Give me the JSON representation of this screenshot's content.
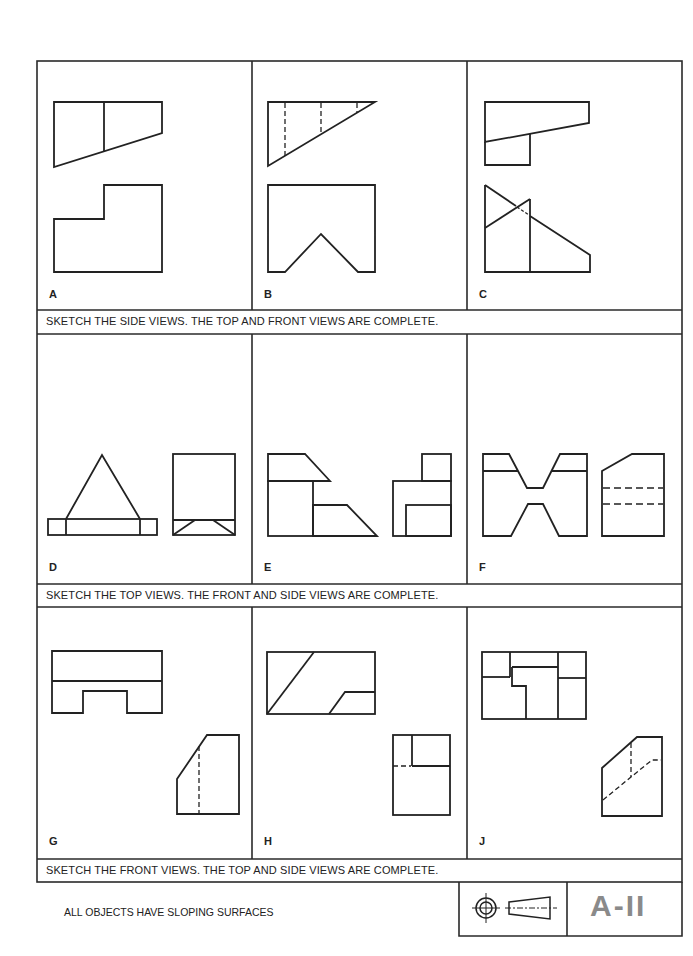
{
  "worksheet": {
    "sheet_number": "A-II",
    "footnote": "ALL OBJECTS HAVE SLOPING SURFACES",
    "title_block_icon": "third-angle-projection-symbol",
    "rows": [
      {
        "instruction": "SKETCH THE SIDE VIEWS.  THE TOP AND FRONT VIEWS ARE COMPLETE.",
        "panels": [
          {
            "label": "A",
            "given_views": [
              "top",
              "front"
            ]
          },
          {
            "label": "B",
            "given_views": [
              "top",
              "front"
            ]
          },
          {
            "label": "C",
            "given_views": [
              "top",
              "front"
            ]
          }
        ]
      },
      {
        "instruction": "SKETCH THE TOP VIEWS.  THE FRONT AND SIDE VIEWS ARE COMPLETE.",
        "panels": [
          {
            "label": "D",
            "given_views": [
              "front",
              "side"
            ]
          },
          {
            "label": "E",
            "given_views": [
              "front",
              "side"
            ]
          },
          {
            "label": "F",
            "given_views": [
              "front",
              "side"
            ]
          }
        ]
      },
      {
        "instruction": "SKETCH THE FRONT VIEWS.  THE TOP AND SIDE VIEWS ARE COMPLETE.",
        "panels": [
          {
            "label": "G",
            "given_views": [
              "top",
              "side"
            ]
          },
          {
            "label": "H",
            "given_views": [
              "top",
              "side"
            ]
          },
          {
            "label": "J",
            "given_views": [
              "top",
              "side"
            ]
          }
        ]
      }
    ]
  }
}
